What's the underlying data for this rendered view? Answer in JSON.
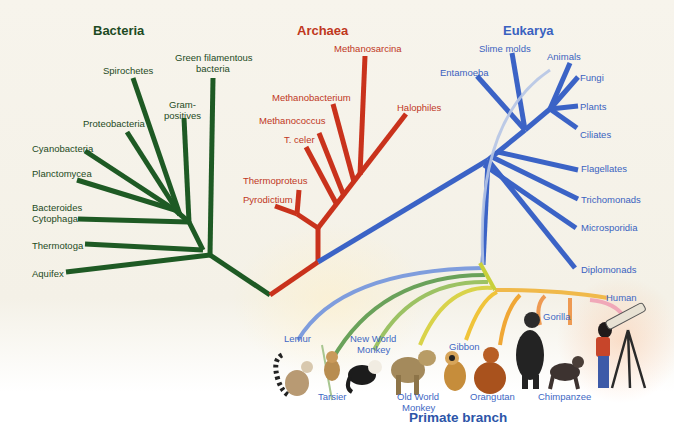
{
  "colors": {
    "bacteria": "#1e5a24",
    "archaea": "#c9321c",
    "eukarya": "#3b63c6",
    "primate_lemur": "#7f9ddd",
    "primate_tarsier": "#6aa25a",
    "primate_nwm": "#9cc264",
    "primate_owm": "#d9d34a",
    "primate_gibbon": "#f0c43a",
    "primate_orangutan": "#f0a735",
    "primate_gorilla": "#ee9a52",
    "primate_human": "#f0a8b8",
    "background": "#f6f3ea"
  },
  "domains": {
    "bacteria": {
      "title": "Bacteria",
      "leaves": [
        "Green filamentous",
        "bacteria",
        "Spirochetes",
        "Gram-",
        "positives",
        "Proteobacteria",
        "Cyanobacteria",
        "Planctomycea",
        "Bacteroides",
        "Cytophaga",
        "Thermotoga",
        "Aquifex"
      ]
    },
    "archaea": {
      "title": "Archaea",
      "leaves": [
        "Methanosarcina",
        "Methanobacterium",
        "Halophiles",
        "Methanococcus",
        "T. celer",
        "Thermoproteus",
        "Pyrodictium"
      ]
    },
    "eukarya": {
      "title": "Eukarya",
      "leaves": [
        "Slime molds",
        "Animals",
        "Entamoeba",
        "Fungi",
        "Plants",
        "Ciliates",
        "Flagellates",
        "Trichomonads",
        "Microsporidia",
        "Diplomonads"
      ]
    }
  },
  "primates": {
    "title": "Primate branch",
    "labels": {
      "lemur": "Lemur",
      "tarsier": "Tarsier",
      "nwm_1": "New World",
      "nwm_2": "Monkey",
      "owm_1": "Old World",
      "owm_2": "Monkey",
      "gibbon": "Gibbon",
      "orangutan": "Orangutan",
      "gorilla": "Gorilla",
      "chimpanzee": "Chimpanzee",
      "human": "Human"
    }
  }
}
